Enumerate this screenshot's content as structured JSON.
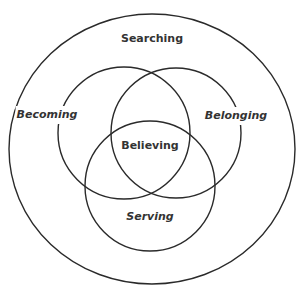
{
  "diagram": {
    "colors": {
      "background": "#ffffff",
      "stroke": "#2a2a2a",
      "text": "#333333"
    },
    "outer": {
      "label": "Searching",
      "style": "bold",
      "shape": {
        "cx": 152,
        "cy": 149,
        "rx": 143,
        "ry": 135
      },
      "label_pos": {
        "x": 152,
        "y": 39
      }
    },
    "circles": [
      {
        "id": "becoming",
        "label": "Becoming",
        "style": "bold-italic",
        "shape": {
          "cx": 124,
          "cy": 133,
          "r": 66
        },
        "label_pos": {
          "x": 47,
          "y": 115
        }
      },
      {
        "id": "belonging",
        "label": "Belonging",
        "style": "bold-italic",
        "shape": {
          "cx": 176,
          "cy": 133,
          "r": 65
        },
        "label_pos": {
          "x": 236,
          "y": 116
        }
      },
      {
        "id": "serving",
        "label": "Serving",
        "style": "bold-italic",
        "shape": {
          "cx": 150,
          "cy": 186,
          "r": 65
        },
        "label_pos": {
          "x": 150,
          "y": 217
        }
      }
    ],
    "center": {
      "label": "Believing",
      "style": "bold",
      "label_pos": {
        "x": 150,
        "y": 146
      }
    }
  }
}
